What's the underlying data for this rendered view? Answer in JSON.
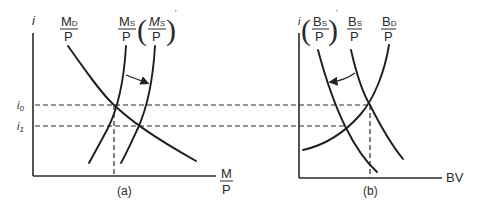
{
  "panel_a": {
    "caption": "(a)",
    "y_axis_label": "i",
    "x_axis_label": {
      "num": "M",
      "den": "P"
    },
    "tick_labels": [
      {
        "main": "i",
        "sub": "0"
      },
      {
        "main": "i",
        "sub": "1"
      }
    ],
    "curves": [
      {
        "name": "money-demand",
        "num_main": "M",
        "num_sub": "D",
        "den": "P"
      },
      {
        "name": "money-supply",
        "num_main": "M",
        "num_sub": "S",
        "den": "P"
      },
      {
        "name": "money-supply-shifted",
        "num_main": "M",
        "num_sub": "S",
        "den": "P",
        "prime": "'"
      }
    ],
    "shift_arrow": "rightward"
  },
  "panel_b": {
    "caption": "(b)",
    "y_axis_label": "i",
    "x_axis_label": "BV",
    "curves": [
      {
        "name": "bond-supply-shifted",
        "num_main": "B",
        "num_sub": "S",
        "den": "P",
        "prime": "'"
      },
      {
        "name": "bond-supply",
        "num_main": "B",
        "num_sub": "S",
        "den": "P"
      },
      {
        "name": "bond-demand",
        "num_main": "B",
        "num_sub": "D",
        "den": "P"
      }
    ],
    "shift_arrow": "leftward"
  },
  "colors": {
    "ink": "#1e1e1e",
    "background": "#ffffff"
  }
}
